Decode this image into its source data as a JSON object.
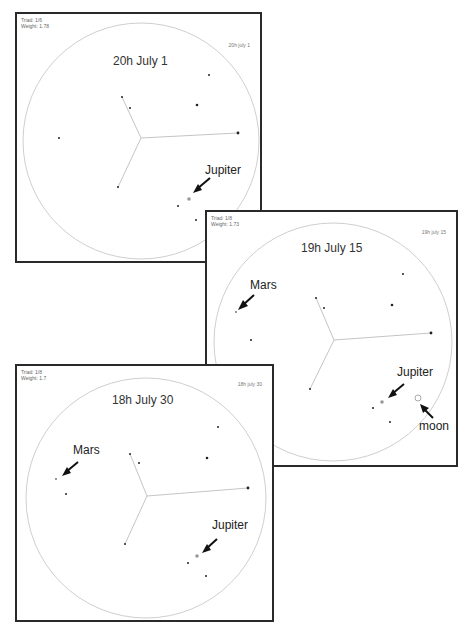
{
  "panels": [
    {
      "id": "july1",
      "meta": {
        "triad": "Triad: 1/6",
        "weight": "Weight: 1.78"
      },
      "corner_label": "20h july 1",
      "title": "20h July 1",
      "annotations": [
        {
          "label": "Jupiter",
          "target": "jupiter"
        }
      ]
    },
    {
      "id": "july15",
      "meta": {
        "triad": "Triad: 1/8",
        "weight": "Weight: 1.73"
      },
      "corner_label": "19h july 15",
      "title": "19h July 15",
      "annotations": [
        {
          "label": "Mars",
          "target": "mars"
        },
        {
          "label": "Jupiter",
          "target": "jupiter"
        },
        {
          "label": "moon",
          "target": "moon"
        }
      ]
    },
    {
      "id": "july30",
      "meta": {
        "triad": "Triad: 1/8",
        "weight": "Weight: 1.7"
      },
      "corner_label": "18h july 30",
      "title": "18h July 30",
      "annotations": [
        {
          "label": "Mars",
          "target": "mars"
        },
        {
          "label": "Jupiter",
          "target": "jupiter"
        }
      ]
    }
  ],
  "icons": {
    "arrow": "arrow-pointer-icon",
    "planet": "planet-marker-icon",
    "star": "star-dot-icon"
  },
  "colors": {
    "border": "#2a2a2a",
    "circle": "#c8c8c8",
    "lines": "#b0b0b0",
    "stars": "#222222",
    "planet": "#9a9a9a"
  }
}
